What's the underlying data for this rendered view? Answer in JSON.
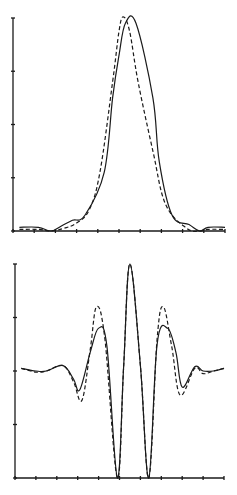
{
  "chart_data": [
    {
      "type": "line",
      "title": "",
      "xlabel": "",
      "ylabel": "",
      "grid": false,
      "legend": null,
      "x_ticks": 10,
      "y_ticks": 4,
      "xlim": [
        0,
        10
      ],
      "ylim": [
        0,
        4
      ],
      "series": [
        {
          "name": "solid",
          "style": "solid",
          "x": [
            0.3,
            1.2,
            1.8,
            2.3,
            2.8,
            3.4,
            4.3,
            4.7,
            5.0,
            5.3,
            5.8,
            6.6,
            6.9,
            7.5,
            8.3,
            8.8,
            9.2,
            10.0
          ],
          "y": [
            0.07,
            0.07,
            0.0,
            0.1,
            0.2,
            0.3,
            1.1,
            2.5,
            3.3,
            3.9,
            3.9,
            2.5,
            1.3,
            0.3,
            0.12,
            0.0,
            0.07,
            0.07
          ]
        },
        {
          "name": "dashed",
          "style": "dashed",
          "x": [
            0.3,
            1.2,
            1.8,
            2.4,
            3.0,
            3.6,
            4.1,
            4.7,
            5.0,
            5.2,
            5.5,
            5.9,
            6.6,
            7.2,
            8.2,
            8.8,
            9.2,
            10.0
          ],
          "y": [
            0.03,
            0.03,
            0.0,
            0.05,
            0.15,
            0.4,
            1.1,
            2.8,
            3.75,
            4.02,
            3.75,
            2.8,
            1.5,
            0.5,
            0.05,
            0.0,
            0.03,
            0.03
          ]
        }
      ]
    },
    {
      "type": "line",
      "title": "",
      "xlabel": "",
      "ylabel": "",
      "grid": false,
      "legend": null,
      "x_ticks": 10,
      "y_ticks": 4,
      "xlim": [
        0,
        10
      ],
      "ylim": [
        -2,
        2
      ],
      "series": [
        {
          "name": "solid",
          "style": "solid",
          "x": [
            0.3,
            1.0,
            1.5,
            2.3,
            2.8,
            3.1,
            3.6,
            4.0,
            4.4,
            4.9,
            5.2,
            5.5,
            6.0,
            6.4,
            6.8,
            7.3,
            7.7,
            8.0,
            8.6,
            9.0,
            9.5,
            10.0
          ],
          "y": [
            0.05,
            0.0,
            0.0,
            0.1,
            -0.15,
            -0.35,
            0.35,
            0.8,
            0.45,
            -2.0,
            0.1,
            2.0,
            0.1,
            -2.0,
            0.5,
            0.8,
            0.35,
            -0.3,
            0.08,
            0.0,
            0.0,
            0.05
          ]
        },
        {
          "name": "dashed",
          "style": "dashed",
          "x": [
            0.3,
            1.0,
            1.5,
            2.3,
            2.8,
            3.2,
            3.6,
            3.9,
            4.3,
            4.9,
            5.2,
            5.5,
            6.0,
            6.4,
            6.8,
            7.1,
            7.5,
            7.9,
            8.6,
            9.0,
            9.5,
            10.0
          ],
          "y": [
            0.05,
            -0.02,
            0.0,
            0.1,
            -0.2,
            -0.55,
            0.4,
            1.2,
            0.6,
            -2.0,
            0.1,
            2.0,
            0.1,
            -2.0,
            0.6,
            1.2,
            0.45,
            -0.45,
            0.05,
            -0.05,
            0.0,
            0.05
          ]
        }
      ]
    }
  ],
  "plots": [
    {
      "id": "top",
      "frame": {
        "x0": 13,
        "x1": 225,
        "y_bottom": 231,
        "y_top": 18
      }
    },
    {
      "id": "bottom",
      "frame": {
        "x0": 15,
        "x1": 224,
        "y_bottom": 478,
        "y_top": 264
      }
    }
  ]
}
